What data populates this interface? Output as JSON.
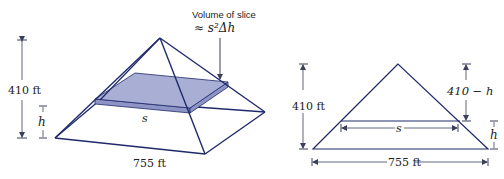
{
  "figure": {
    "left": {
      "title": "3D pyramid with horizontal slice",
      "annotation_line1": "Volume of slice",
      "annotation_line2": "≈ s²Δh",
      "height_label": "410 ft",
      "h_label": "h",
      "s_label": "s",
      "base_label": "755 ft"
    },
    "right": {
      "title": "Cross-section triangle",
      "height_label": "410 ft",
      "top_label": "410 − h",
      "h_label": "h",
      "s_label": "s",
      "base_label": "755 ft"
    },
    "colors": {
      "edge": "#1f2a6b",
      "slice_fill": "#a9aed4",
      "slice_side": "#8e95c6",
      "dim": "#3a3f5c",
      "text": "#222222"
    }
  }
}
